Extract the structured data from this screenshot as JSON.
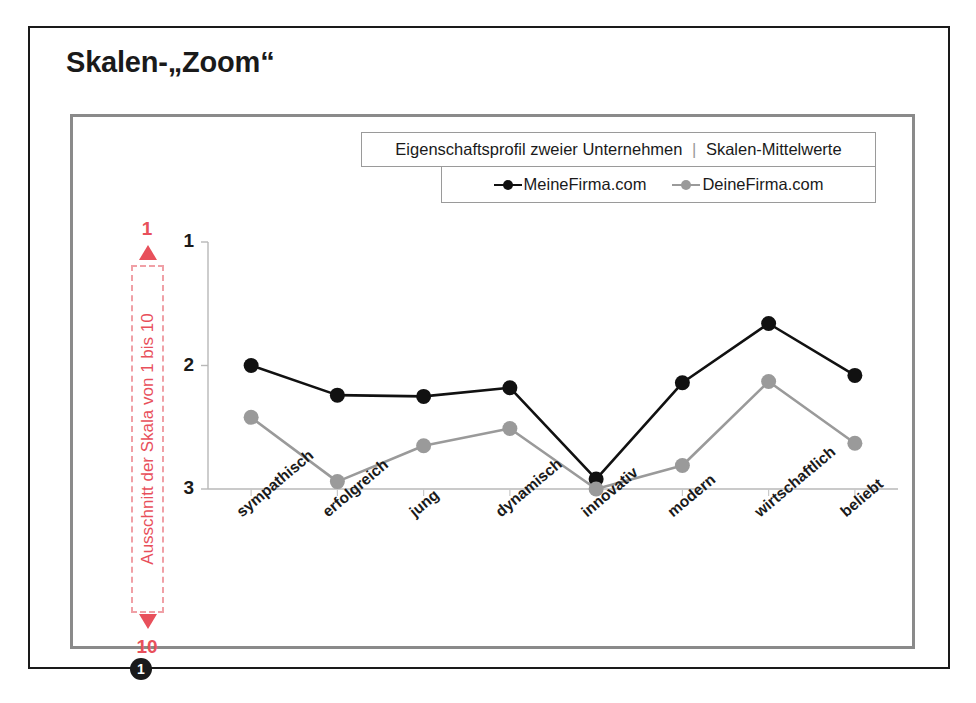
{
  "slide": {
    "title": "Skalen-„Zoom“",
    "step_marker": "1"
  },
  "chart_title": {
    "left": "Eigenschaftsprofil zweier Unternehmen",
    "separator": "|",
    "right": "Skalen-Mittelwerte"
  },
  "legend": {
    "entries": [
      {
        "label": "MeineFirma.com",
        "color": "#111111",
        "icon": "line-marker-icon"
      },
      {
        "label": "DeineFirma.com",
        "color": "#9a9a9a",
        "icon": "line-marker-icon"
      }
    ]
  },
  "annotation": {
    "top_value": "1",
    "bottom_value": "10",
    "text": "Ausschnitt der Skala von 1 bis 10",
    "color": "#e8505b",
    "arrow_up": "arrow-up-icon",
    "arrow_down": "arrow-down-icon"
  },
  "chart_data": {
    "type": "line",
    "title": "Eigenschaftsprofil zweier Unternehmen | Skalen-Mittelwerte",
    "xlabel": "",
    "ylabel": "",
    "categories": [
      "sympathisch",
      "erfolgreich",
      "jung",
      "dynamisch",
      "innovativ",
      "modern",
      "wirtschaftlich",
      "beliebt"
    ],
    "yticks": [
      "1",
      "2",
      "3"
    ],
    "ytick_values": [
      1,
      2,
      3
    ],
    "ylim": [
      1,
      3
    ],
    "y_inverted": true,
    "grid": false,
    "legend_position": "top-right",
    "series": [
      {
        "name": "MeineFirma.com",
        "color": "#111111",
        "values": [
          2.0,
          2.24,
          2.25,
          2.18,
          2.92,
          2.14,
          1.66,
          2.08
        ]
      },
      {
        "name": "DeineFirma.com",
        "color": "#9a9a9a",
        "values": [
          2.42,
          2.94,
          2.65,
          2.51,
          3.0,
          2.81,
          2.13,
          2.63
        ]
      }
    ]
  }
}
